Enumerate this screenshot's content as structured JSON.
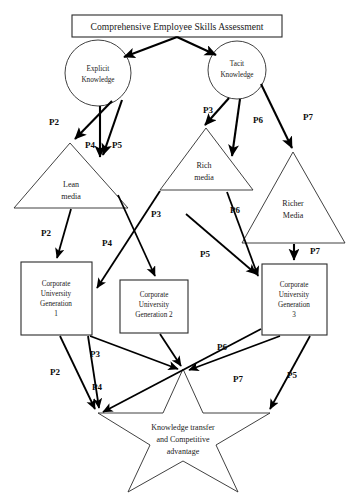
{
  "diagram": {
    "title": "Comprehensive Employee Skills Assessment",
    "nodes": {
      "title_box": {
        "label": "Comprehensive Employee Skills Assessment"
      },
      "explicit_knowledge": {
        "line1": "Explicit",
        "line2": "Knowledge"
      },
      "tacit_knowledge": {
        "line1": "Tacit",
        "line2": "Knowledge"
      },
      "lean_media": {
        "line1": "Lean",
        "line2": "media"
      },
      "rich_media": {
        "line1": "Rich",
        "line2": "media"
      },
      "richer_media": {
        "line1": "Richer",
        "line2": "Media"
      },
      "corporate_university_1": {
        "line1": "Corporate",
        "line2": "University",
        "line3": "Generation",
        "line4": "1"
      },
      "corporate_university_2": {
        "line1": "Corporate",
        "line2": "University",
        "line3": "Generation 2",
        "line4": ""
      },
      "corporate_university_3": {
        "line1": "Corporate",
        "line2": "University",
        "line3": "Generation",
        "line4": "3"
      },
      "outcome_star": {
        "line1": "Knowledge transfer",
        "line2": "and Competitive",
        "line3": "advantage"
      }
    },
    "edge_labels": [
      {
        "id": "p2-explicit-lean",
        "text": "P2"
      },
      {
        "id": "p4-explicit-lean",
        "text": "P4"
      },
      {
        "id": "p5-explicit-lean",
        "text": "P5"
      },
      {
        "id": "p3-tacit-rich",
        "text": "P3"
      },
      {
        "id": "p6-tacit-rich",
        "text": "P6"
      },
      {
        "id": "p7-tacit-richer",
        "text": "P7"
      },
      {
        "id": "p2-lean-cu1",
        "text": "P2"
      },
      {
        "id": "p3-lean-rich-cross",
        "text": "P3"
      },
      {
        "id": "p4-lean-cu2",
        "text": "P4"
      },
      {
        "id": "p6-rich-cu3",
        "text": "P6"
      },
      {
        "id": "p5-rich-cu3",
        "text": "P5"
      },
      {
        "id": "p7-richer-cu3",
        "text": "P7"
      },
      {
        "id": "p2-cu1-star",
        "text": "P2"
      },
      {
        "id": "p3-cu1-star",
        "text": "P3"
      },
      {
        "id": "p4-cu2-star",
        "text": "P4"
      },
      {
        "id": "p6-cu3-left",
        "text": "P6"
      },
      {
        "id": "p7-cu3-star",
        "text": "P7"
      },
      {
        "id": "p5-cu3-star",
        "text": "P5"
      }
    ],
    "colors": {
      "shape_stroke": "#2b2b2b",
      "arrow_stroke": "#000000",
      "text": "#1a1a1a",
      "background": "#ffffff"
    }
  }
}
